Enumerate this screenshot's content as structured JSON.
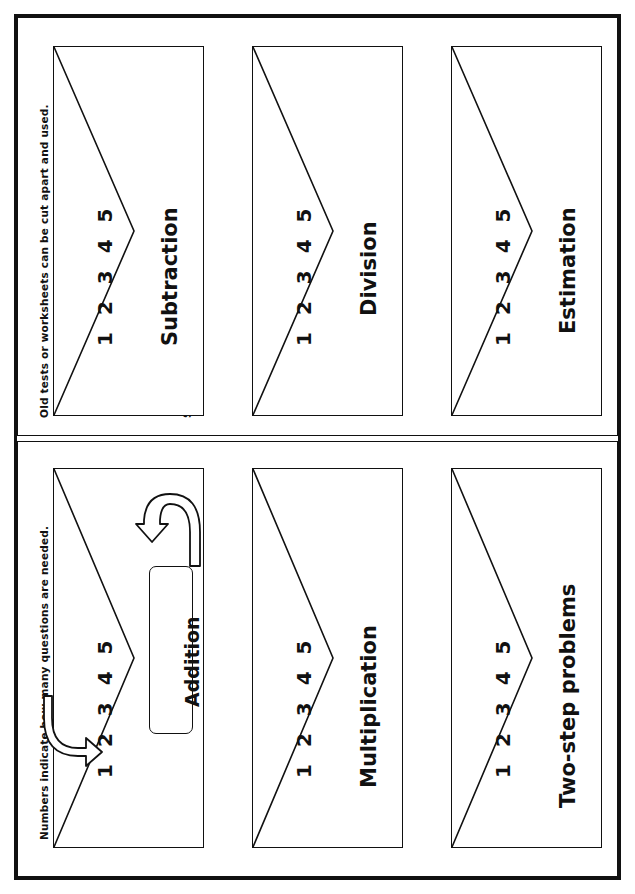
{
  "document": {
    "title": "Math practice envelopes",
    "orientation": "rotated-90",
    "ink_color": "#111111",
    "paper_color": "#ffffff"
  },
  "panels": [
    {
      "id": "panel-top",
      "name": "upper-page",
      "captions": {
        "outer_edge": "Old tests or worksheets can be cut apart and used.",
        "inner_edge": "Students also can create their own problems."
      },
      "envelopes": [
        {
          "title": "Subtraction",
          "numbers": "1 2 3 4 5"
        },
        {
          "title": "Division",
          "numbers": "1 2 3 4 5"
        },
        {
          "title": "Estimation",
          "numbers": "1 2 3 4 5"
        }
      ]
    },
    {
      "id": "panel-bottom",
      "name": "lower-page",
      "captions": {
        "outer_edge": "Numbers indicate how many questions are needed.",
        "inner_edge": "Folder labels can be used to mark envelopes."
      },
      "envelopes": [
        {
          "title": "Addition",
          "numbers": "1 2 3 4 5",
          "label_box": "Addition"
        },
        {
          "title": "Multiplication",
          "numbers": "1 2 3 4 5"
        },
        {
          "title": "Two-step problems",
          "numbers": "1 2 3 4 5"
        }
      ]
    }
  ],
  "annotations": {
    "hook_arrow_lower_left": "curved-hook-arrow",
    "hook_arrow_upper_right": "curved-hook-arrow"
  }
}
